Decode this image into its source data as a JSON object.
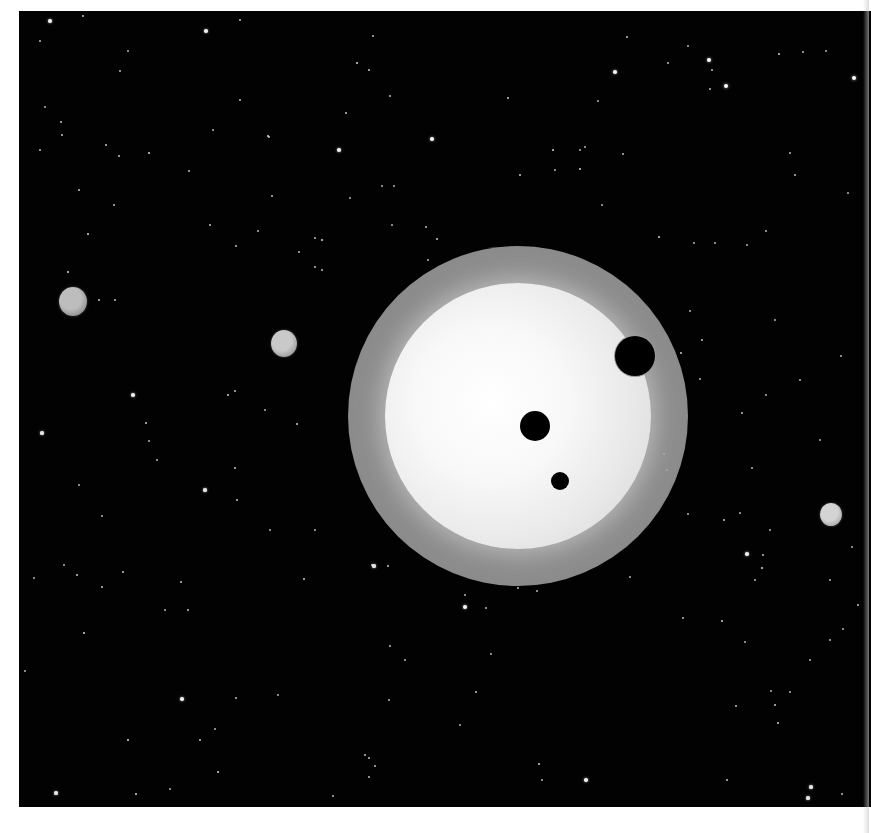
{
  "scene": {
    "title": "Star with multiple transiting exoplanets",
    "background_color": "#020202",
    "frame": {
      "left": 19,
      "top": 11,
      "width": 852,
      "height": 796
    }
  },
  "host_star": {
    "cx": 518,
    "cy": 416,
    "radius": 133,
    "glow_radius": 170,
    "core_color": "#ffffff",
    "limb_color": "#d8d8d8",
    "glow_color": "#8a8a8a"
  },
  "transiting_planets": [
    {
      "name": "transit-large",
      "cx": 635,
      "cy": 356,
      "r": 20,
      "rim_color": "#9a9a9a"
    },
    {
      "name": "transit-medium",
      "cx": 535,
      "cy": 426,
      "r": 15,
      "rim_color": ""
    },
    {
      "name": "transit-small",
      "cx": 560,
      "cy": 481,
      "r": 9,
      "rim_color": ""
    }
  ],
  "background_planets": [
    {
      "name": "planet-far-left",
      "cx": 73,
      "cy": 301,
      "r": 14,
      "color": "#bdbdbd",
      "shade": "#6f6f6f"
    },
    {
      "name": "planet-left",
      "cx": 284,
      "cy": 343,
      "r": 13,
      "color": "#c9c9c9",
      "shade": "#7a7a7a"
    },
    {
      "name": "planet-right",
      "cx": 831,
      "cy": 514,
      "r": 11,
      "color": "#d4d4d4",
      "shade": "#8c8c8c"
    }
  ],
  "stars": [
    [
      50,
      21,
      2.2
    ],
    [
      83,
      16,
      1.5
    ],
    [
      40,
      41,
      1
    ],
    [
      128,
      51,
      1.2
    ],
    [
      206,
      31,
      2.2
    ],
    [
      240,
      20,
      1
    ],
    [
      357,
      63,
      1.8
    ],
    [
      369,
      70,
      1.6
    ],
    [
      373,
      36,
      1.4
    ],
    [
      390,
      96,
      1
    ],
    [
      240,
      100,
      1
    ],
    [
      120,
      71,
      1
    ],
    [
      580,
      150,
      1.2
    ],
    [
      615,
      72,
      2.2
    ],
    [
      627,
      37,
      1.5
    ],
    [
      668,
      63,
      1
    ],
    [
      688,
      46,
      1.2
    ],
    [
      709,
      60,
      2.4
    ],
    [
      712,
      70,
      1.4
    ],
    [
      710,
      89,
      1.4
    ],
    [
      726,
      86,
      3
    ],
    [
      779,
      54,
      1.8
    ],
    [
      803,
      52,
      1.2
    ],
    [
      826,
      51,
      1.2
    ],
    [
      854,
      78,
      2.8
    ],
    [
      508,
      98,
      1.6
    ],
    [
      598,
      101,
      1.2
    ],
    [
      553,
      150,
      1.8
    ],
    [
      585,
      147,
      1.2
    ],
    [
      580,
      169,
      1.8
    ],
    [
      623,
      154,
      1.4
    ],
    [
      520,
      175,
      1.6
    ],
    [
      555,
      170,
      1.2
    ],
    [
      790,
      153,
      1.4
    ],
    [
      795,
      175,
      1.4
    ],
    [
      848,
      193,
      1.2
    ],
    [
      602,
      205,
      1.2
    ],
    [
      659,
      237,
      1.8
    ],
    [
      694,
      243,
      1.2
    ],
    [
      715,
      243,
      1.2
    ],
    [
      766,
      231,
      1.4
    ],
    [
      45,
      107,
      1.2
    ],
    [
      61,
      122,
      1.5
    ],
    [
      62,
      135,
      1.5
    ],
    [
      40,
      150,
      1.4
    ],
    [
      106,
      145,
      1.5
    ],
    [
      119,
      156,
      1.5
    ],
    [
      149,
      153,
      1.8
    ],
    [
      189,
      171,
      1.4
    ],
    [
      213,
      130,
      1.2
    ],
    [
      268,
      136,
      1.8
    ],
    [
      269,
      137,
      1.4
    ],
    [
      339,
      150,
      2.2
    ],
    [
      346,
      113,
      1.5
    ],
    [
      382,
      186,
      1.2
    ],
    [
      394,
      186,
      1.2
    ],
    [
      350,
      198,
      1.2
    ],
    [
      272,
      196,
      1.4
    ],
    [
      79,
      190,
      1.6
    ],
    [
      88,
      234,
      1.8
    ],
    [
      114,
      205,
      1.4
    ],
    [
      210,
      225,
      1.5
    ],
    [
      258,
      231,
      1.4
    ],
    [
      236,
      246,
      1.4
    ],
    [
      299,
      252,
      1.4
    ],
    [
      315,
      238,
      1.4
    ],
    [
      322,
      240,
      1.8
    ],
    [
      315,
      267,
      1.4
    ],
    [
      322,
      270,
      1.4
    ],
    [
      392,
      225,
      1.2
    ],
    [
      428,
      260,
      1.4
    ],
    [
      432,
      139,
      2.2
    ],
    [
      437,
      239,
      1.6
    ],
    [
      426,
      227,
      1.4
    ],
    [
      68,
      272,
      1.8
    ],
    [
      99,
      300,
      1.6
    ],
    [
      115,
      300,
      1.5
    ],
    [
      235,
      391,
      1.4
    ],
    [
      133,
      395,
      2.2
    ],
    [
      146,
      423,
      1.6
    ],
    [
      42,
      433,
      2
    ],
    [
      149,
      441,
      1.2
    ],
    [
      157,
      460,
      1.2
    ],
    [
      228,
      395,
      1.6
    ],
    [
      265,
      410,
      1.2
    ],
    [
      297,
      424,
      1.6
    ],
    [
      235,
      468,
      1.6
    ],
    [
      205,
      490,
      2
    ],
    [
      237,
      500,
      1.6
    ],
    [
      270,
      530,
      1.2
    ],
    [
      315,
      530,
      1.2
    ],
    [
      79,
      485,
      1.2
    ],
    [
      102,
      516,
      1.2
    ],
    [
      64,
      565,
      1.2
    ],
    [
      77,
      575,
      1.6
    ],
    [
      123,
      572,
      1.6
    ],
    [
      181,
      582,
      1.5
    ],
    [
      304,
      579,
      1.6
    ],
    [
      372,
      565,
      1.5
    ],
    [
      374,
      566,
      2
    ],
    [
      388,
      566,
      1.5
    ],
    [
      34,
      578,
      1.2
    ],
    [
      102,
      587,
      1.5
    ],
    [
      84,
      633,
      1.8
    ],
    [
      165,
      610,
      1.2
    ],
    [
      188,
      610,
      1.5
    ],
    [
      25,
      671,
      1.2
    ],
    [
      182,
      699,
      2.2
    ],
    [
      236,
      698,
      1.4
    ],
    [
      278,
      695,
      1.2
    ],
    [
      128,
      740,
      1.8
    ],
    [
      200,
      740,
      1.5
    ],
    [
      215,
      729,
      1.2
    ],
    [
      218,
      772,
      1.8
    ],
    [
      136,
      794,
      1.8
    ],
    [
      170,
      789,
      1.2
    ],
    [
      56,
      793,
      2
    ],
    [
      333,
      796,
      1.2
    ],
    [
      365,
      755,
      1.4
    ],
    [
      369,
      758,
      1.4
    ],
    [
      375,
      766,
      1.4
    ],
    [
      369,
      777,
      1.4
    ],
    [
      390,
      646,
      1.4
    ],
    [
      389,
      700,
      1.2
    ],
    [
      465,
      607,
      2.4
    ],
    [
      486,
      608,
      1.2
    ],
    [
      518,
      588,
      1.5
    ],
    [
      465,
      595,
      1.2
    ],
    [
      537,
      591,
      1.2
    ],
    [
      491,
      654,
      1.2
    ],
    [
      476,
      692,
      1.6
    ],
    [
      539,
      764,
      1.8
    ],
    [
      586,
      780,
      2.2
    ],
    [
      683,
      618,
      1.4
    ],
    [
      722,
      621,
      1.6
    ],
    [
      736,
      706,
      1.6
    ],
    [
      771,
      691,
      1.2
    ],
    [
      775,
      705,
      1.6
    ],
    [
      778,
      723,
      1.6
    ],
    [
      790,
      692,
      1.2
    ],
    [
      727,
      780,
      1.6
    ],
    [
      811,
      787,
      2
    ],
    [
      808,
      798,
      2
    ],
    [
      842,
      794,
      1.4
    ],
    [
      858,
      605,
      1.5
    ],
    [
      843,
      629,
      1.2
    ],
    [
      755,
      580,
      1.2
    ],
    [
      830,
      580,
      1.2
    ],
    [
      405,
      660,
      1.2
    ],
    [
      460,
      725,
      1.2
    ],
    [
      542,
      780,
      1.2
    ],
    [
      681,
      353,
      1.6
    ],
    [
      702,
      340,
      1.6
    ],
    [
      700,
      379,
      1.2
    ],
    [
      742,
      413,
      1.4
    ],
    [
      724,
      520,
      1.6
    ],
    [
      763,
      555,
      1.4
    ],
    [
      664,
      454,
      1.6
    ],
    [
      667,
      470,
      1.4
    ],
    [
      752,
      468,
      1.2
    ],
    [
      770,
      530,
      1.2
    ],
    [
      841,
      356,
      1.2
    ],
    [
      690,
      311,
      1.2
    ],
    [
      775,
      320,
      1.2
    ],
    [
      800,
      380,
      1.2
    ],
    [
      766,
      395,
      1.2
    ],
    [
      747,
      245,
      1.2
    ],
    [
      820,
      440,
      1.2
    ],
    [
      740,
      513,
      1.2
    ],
    [
      688,
      514,
      1.2
    ],
    [
      747,
      554,
      2.2
    ],
    [
      762,
      568,
      1.8
    ],
    [
      852,
      547,
      1.2
    ],
    [
      630,
      577,
      1.2
    ],
    [
      745,
      642,
      1.2
    ],
    [
      810,
      660,
      1.2
    ],
    [
      830,
      640,
      1.2
    ]
  ]
}
